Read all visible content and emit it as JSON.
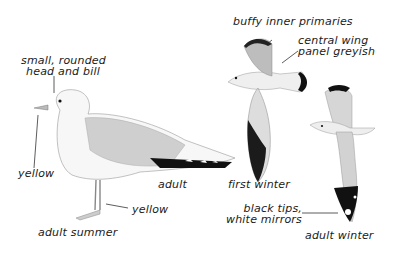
{
  "plate": {
    "colors": {
      "background": "#ffffff",
      "ink": "#1a1a1a",
      "mantle_grey": "#c8c8c8",
      "wingtip_black": "#111111"
    },
    "figures": [
      {
        "id": "adult-summer",
        "caption": "adult summer",
        "annotations": [
          {
            "line1": "small, rounded",
            "line2": "head and bill"
          },
          {
            "text": "yellow",
            "target": "bill"
          },
          {
            "text": "yellow",
            "target": "legs"
          },
          {
            "text": "adult"
          }
        ]
      },
      {
        "id": "first-winter",
        "caption": "first winter",
        "annotations": [
          {
            "text": "buffy inner primaries"
          },
          {
            "line1": "central wing",
            "line2": "panel greyish"
          }
        ]
      },
      {
        "id": "adult-winter",
        "caption": "adult winter",
        "annotations": [
          {
            "line1": "black tips,",
            "line2": "white mirrors"
          }
        ]
      }
    ]
  }
}
